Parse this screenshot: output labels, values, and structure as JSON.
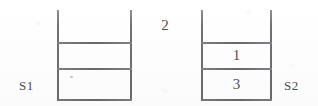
{
  "diagram": {
    "background_color": "#fefefe",
    "line_color": "#6f7177",
    "text_color": "#4e5056"
  },
  "floating_value": {
    "text": "2"
  },
  "stacks": [
    {
      "id": "s1",
      "label": "S1",
      "label_side": "left",
      "cells": [
        {
          "slot": "top",
          "text": ""
        },
        {
          "slot": "middle",
          "text": ""
        },
        {
          "slot": "bottom",
          "text": ""
        }
      ]
    },
    {
      "id": "s2",
      "label": "S2",
      "label_side": "right",
      "cells": [
        {
          "slot": "top",
          "text": ""
        },
        {
          "slot": "middle",
          "text": "1"
        },
        {
          "slot": "bottom",
          "text": "3"
        }
      ]
    }
  ]
}
